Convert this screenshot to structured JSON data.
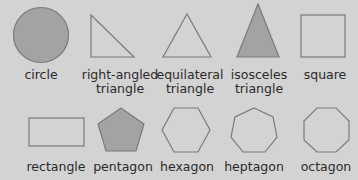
{
  "colors": {
    "background": "#d3d3d3",
    "stroke": "#7a7a7a",
    "fill_dark": "#a3a3a3",
    "fill_light": "#d3d3d3",
    "text": "#2a2a2a"
  },
  "shapes": [
    {
      "id": "circle",
      "label": "circle",
      "label_line2": "",
      "filled": true
    },
    {
      "id": "right-angled-triangle",
      "label": "right-angled",
      "label_line2": "triangle",
      "filled": false
    },
    {
      "id": "equilateral-triangle",
      "label": "equilateral",
      "label_line2": "triangle",
      "filled": false
    },
    {
      "id": "isosceles-triangle",
      "label": "isosceles",
      "label_line2": "triangle",
      "filled": true
    },
    {
      "id": "square",
      "label": "square",
      "label_line2": "",
      "filled": false
    },
    {
      "id": "rectangle",
      "label": "rectangle",
      "label_line2": "",
      "filled": false
    },
    {
      "id": "pentagon",
      "label": "pentagon",
      "label_line2": "",
      "filled": true
    },
    {
      "id": "hexagon",
      "label": "hexagon",
      "label_line2": "",
      "filled": false
    },
    {
      "id": "heptagon",
      "label": "heptagon",
      "label_line2": "",
      "filled": false
    },
    {
      "id": "octagon",
      "label": "octagon",
      "label_line2": "",
      "filled": false
    }
  ]
}
